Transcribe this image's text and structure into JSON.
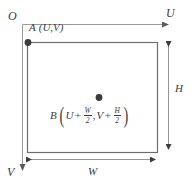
{
  "figure": {
    "type": "geometry-diagram",
    "background_color": "#ffffff",
    "line_color": "#6e6e6e",
    "axis_color": "#8a8a8a",
    "text_color": "#3a3a3a",
    "dot_color": "#3c3c3c"
  },
  "axes": {
    "origin_label": "O",
    "horizontal_axis_label": "U",
    "vertical_axis_label": "V"
  },
  "points": {
    "corner": {
      "name": "A",
      "coords": "(U,V)"
    },
    "center": {
      "name": "B",
      "u_base": "U",
      "u_plus": "+",
      "u_frac_num": "W",
      "u_frac_den": "2",
      "separator": ",",
      "v_base": "V",
      "v_plus": "+",
      "v_frac_num": "H",
      "v_frac_den": "2"
    }
  },
  "dimensions": {
    "height_label": "H",
    "width_label": "W"
  }
}
